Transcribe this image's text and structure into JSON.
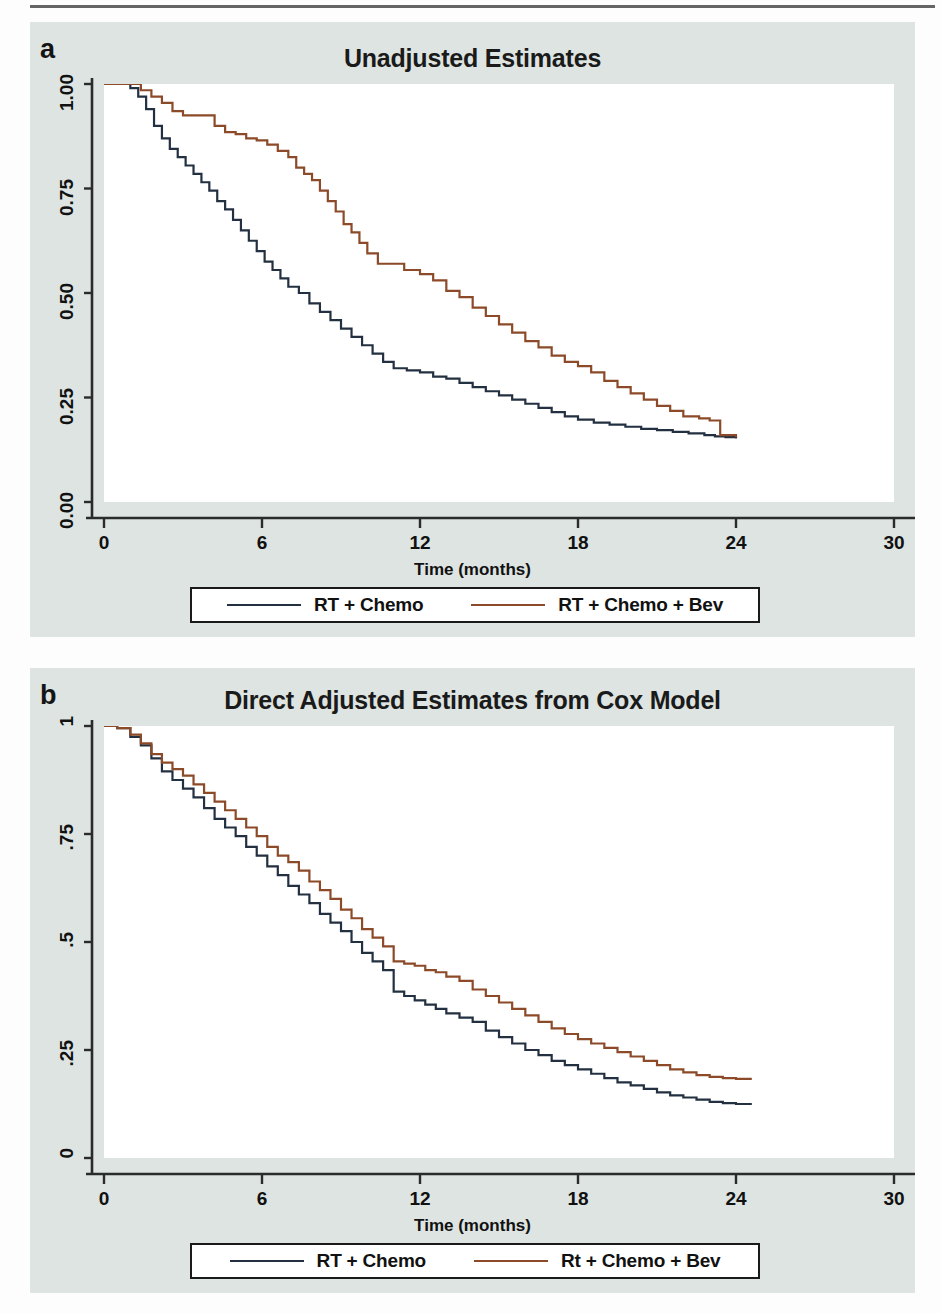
{
  "figure": {
    "panels": [
      {
        "letter": "a",
        "title": "Unadjusted Estimates",
        "xlabel": "Time (months)",
        "legend": [
          {
            "label": "RT + Chemo",
            "color": "#233041"
          },
          {
            "label": "RT + Chemo + Bev",
            "color": "#8c4a28"
          }
        ]
      },
      {
        "letter": "b",
        "title": "Direct Adjusted Estimates from Cox Model",
        "xlabel": "Time (months)",
        "legend": [
          {
            "label": "RT + Chemo",
            "color": "#233041"
          },
          {
            "label": "Rt + Chemo + Bev",
            "color": "#8c4a28"
          }
        ]
      }
    ]
  },
  "chart_data": [
    {
      "type": "line",
      "title": "Unadjusted Estimates",
      "xlabel": "Time (months)",
      "ylabel": "",
      "xlim": [
        0,
        30
      ],
      "ylim": [
        0,
        1
      ],
      "xticks": [
        0,
        6,
        12,
        18,
        24,
        30
      ],
      "xticklabels": [
        "0",
        "6",
        "12",
        "18",
        "24",
        "30"
      ],
      "yticks": [
        0,
        0.25,
        0.5,
        0.75,
        1
      ],
      "yticklabels": [
        "0.00",
        "0.25",
        "0.50",
        "0.75",
        "1.00"
      ],
      "grid": false,
      "legend_position": "below",
      "step": true,
      "series": [
        {
          "name": "RT + Chemo",
          "color": "#233041",
          "x": [
            0.0,
            0.6,
            1.0,
            1.3,
            1.6,
            1.9,
            2.2,
            2.5,
            2.8,
            3.1,
            3.4,
            3.7,
            4.0,
            4.3,
            4.6,
            4.9,
            5.2,
            5.5,
            5.8,
            6.1,
            6.4,
            6.7,
            7.0,
            7.4,
            7.8,
            8.2,
            8.6,
            9.0,
            9.4,
            9.8,
            10.2,
            10.6,
            11.0,
            11.5,
            12.0,
            12.5,
            13.0,
            13.5,
            14.0,
            14.5,
            15.0,
            15.5,
            16.0,
            16.5,
            17.0,
            17.5,
            18.0,
            18.6,
            19.2,
            19.8,
            20.4,
            21.0,
            21.6,
            22.2,
            22.8,
            23.2,
            23.6,
            24.0
          ],
          "y": [
            1.0,
            1.0,
            0.99,
            0.97,
            0.94,
            0.9,
            0.87,
            0.845,
            0.825,
            0.805,
            0.785,
            0.765,
            0.745,
            0.72,
            0.7,
            0.675,
            0.65,
            0.625,
            0.6,
            0.575,
            0.555,
            0.535,
            0.515,
            0.5,
            0.475,
            0.455,
            0.435,
            0.415,
            0.395,
            0.375,
            0.355,
            0.335,
            0.32,
            0.315,
            0.31,
            0.3,
            0.295,
            0.285,
            0.275,
            0.265,
            0.255,
            0.245,
            0.235,
            0.225,
            0.215,
            0.205,
            0.197,
            0.19,
            0.185,
            0.18,
            0.175,
            0.172,
            0.168,
            0.164,
            0.16,
            0.157,
            0.155,
            0.152
          ]
        },
        {
          "name": "RT + Chemo + Bev",
          "color": "#8c4a28",
          "x": [
            0.0,
            0.8,
            1.4,
            1.8,
            2.2,
            2.6,
            3.0,
            3.4,
            3.8,
            4.2,
            4.6,
            5.0,
            5.4,
            5.8,
            6.2,
            6.6,
            7.0,
            7.3,
            7.6,
            7.9,
            8.2,
            8.5,
            8.8,
            9.1,
            9.4,
            9.7,
            10.0,
            10.4,
            10.8,
            11.4,
            12.0,
            12.5,
            13.0,
            13.5,
            14.0,
            14.5,
            15.0,
            15.5,
            16.0,
            16.5,
            17.0,
            17.5,
            18.0,
            18.5,
            19.0,
            19.5,
            20.0,
            20.5,
            21.0,
            21.5,
            22.0,
            22.6,
            23.0,
            23.4,
            24.0
          ],
          "y": [
            1.0,
            1.0,
            0.985,
            0.97,
            0.955,
            0.935,
            0.925,
            0.925,
            0.925,
            0.9,
            0.885,
            0.88,
            0.87,
            0.865,
            0.855,
            0.84,
            0.825,
            0.8,
            0.785,
            0.77,
            0.745,
            0.72,
            0.695,
            0.665,
            0.645,
            0.62,
            0.595,
            0.57,
            0.57,
            0.555,
            0.545,
            0.53,
            0.505,
            0.49,
            0.465,
            0.445,
            0.425,
            0.405,
            0.385,
            0.37,
            0.35,
            0.335,
            0.325,
            0.31,
            0.29,
            0.275,
            0.26,
            0.245,
            0.23,
            0.218,
            0.205,
            0.2,
            0.195,
            0.16,
            0.155
          ]
        }
      ]
    },
    {
      "type": "line",
      "title": "Direct Adjusted Estimates from Cox Model",
      "xlabel": "Time (months)",
      "ylabel": "",
      "xlim": [
        0,
        30
      ],
      "ylim": [
        0,
        1
      ],
      "xticks": [
        0,
        6,
        12,
        18,
        24,
        30
      ],
      "xticklabels": [
        "0",
        "6",
        "12",
        "18",
        "24",
        "30"
      ],
      "yticks": [
        0,
        0.25,
        0.5,
        0.75,
        1
      ],
      "yticklabels": [
        "0",
        ".25",
        ".5",
        ".75",
        "1"
      ],
      "grid": false,
      "legend_position": "below",
      "step": true,
      "series": [
        {
          "name": "RT + Chemo",
          "color": "#233041",
          "x": [
            0.0,
            0.5,
            1.0,
            1.4,
            1.8,
            2.2,
            2.6,
            3.0,
            3.4,
            3.8,
            4.2,
            4.6,
            5.0,
            5.4,
            5.8,
            6.2,
            6.6,
            7.0,
            7.4,
            7.8,
            8.2,
            8.6,
            9.0,
            9.4,
            9.8,
            10.2,
            10.6,
            11.0,
            11.4,
            11.8,
            12.2,
            12.6,
            13.0,
            13.5,
            14.0,
            14.5,
            15.0,
            15.5,
            16.0,
            16.5,
            17.0,
            17.5,
            18.0,
            18.5,
            19.0,
            19.5,
            20.0,
            20.5,
            21.0,
            21.5,
            22.0,
            22.5,
            23.0,
            23.5,
            24.0,
            24.6
          ],
          "y": [
            1.0,
            0.995,
            0.975,
            0.955,
            0.925,
            0.895,
            0.875,
            0.855,
            0.835,
            0.81,
            0.785,
            0.765,
            0.745,
            0.72,
            0.7,
            0.675,
            0.655,
            0.63,
            0.61,
            0.59,
            0.565,
            0.545,
            0.525,
            0.5,
            0.475,
            0.455,
            0.435,
            0.385,
            0.375,
            0.365,
            0.355,
            0.345,
            0.335,
            0.325,
            0.315,
            0.295,
            0.28,
            0.265,
            0.25,
            0.238,
            0.225,
            0.215,
            0.205,
            0.195,
            0.185,
            0.175,
            0.168,
            0.16,
            0.152,
            0.145,
            0.14,
            0.135,
            0.13,
            0.127,
            0.125,
            0.125
          ]
        },
        {
          "name": "Rt + Chemo + Bev",
          "color": "#8c4a28",
          "x": [
            0.0,
            0.5,
            1.0,
            1.4,
            1.8,
            2.2,
            2.6,
            3.0,
            3.4,
            3.8,
            4.2,
            4.6,
            5.0,
            5.4,
            5.8,
            6.2,
            6.6,
            7.0,
            7.4,
            7.8,
            8.2,
            8.6,
            9.0,
            9.4,
            9.8,
            10.2,
            10.6,
            11.0,
            11.4,
            11.8,
            12.2,
            12.6,
            13.0,
            13.5,
            14.0,
            14.5,
            15.0,
            15.5,
            16.0,
            16.5,
            17.0,
            17.5,
            18.0,
            18.5,
            19.0,
            19.5,
            20.0,
            20.5,
            21.0,
            21.5,
            22.0,
            22.5,
            23.0,
            23.5,
            24.0,
            24.6
          ],
          "y": [
            1.0,
            0.995,
            0.98,
            0.96,
            0.935,
            0.915,
            0.9,
            0.885,
            0.865,
            0.845,
            0.825,
            0.805,
            0.785,
            0.765,
            0.745,
            0.72,
            0.7,
            0.685,
            0.665,
            0.64,
            0.62,
            0.6,
            0.575,
            0.555,
            0.53,
            0.51,
            0.49,
            0.455,
            0.45,
            0.445,
            0.435,
            0.43,
            0.42,
            0.41,
            0.39,
            0.375,
            0.36,
            0.345,
            0.33,
            0.315,
            0.3,
            0.287,
            0.275,
            0.265,
            0.255,
            0.245,
            0.235,
            0.225,
            0.215,
            0.205,
            0.198,
            0.192,
            0.188,
            0.185,
            0.183,
            0.183
          ]
        }
      ]
    }
  ]
}
